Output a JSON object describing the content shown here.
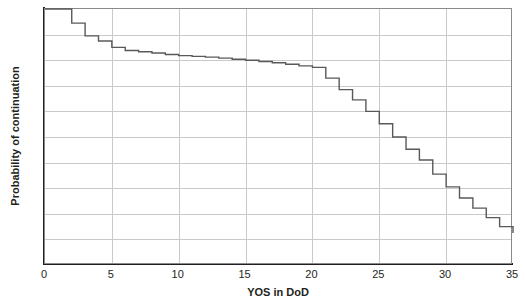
{
  "chart_data": {
    "type": "line",
    "subtype": "step",
    "title": "",
    "xlabel": "YOS in DoD",
    "ylabel": "Probability of continuation",
    "xlim": [
      0,
      35
    ],
    "ylim": [
      0,
      1
    ],
    "grid": true,
    "legend": null,
    "line_color": "#595959",
    "x_ticks": [
      "0",
      "5",
      "10",
      "15",
      "20",
      "25",
      "30",
      "35"
    ],
    "x_tick_values": [
      0,
      5,
      10,
      15,
      20,
      25,
      30,
      35
    ],
    "y_ticks": [
      "0",
      "0.1",
      "0.2",
      "0.3",
      "0.4",
      "0.5",
      "0.6",
      "0.7",
      "0.8",
      "0.9",
      "1"
    ],
    "y_tick_values": [
      0,
      0.1,
      0.2,
      0.3,
      0.4,
      0.5,
      0.6,
      0.7,
      0.8,
      0.9,
      1
    ],
    "x": [
      0,
      1,
      2,
      3,
      4,
      5,
      6,
      7,
      8,
      9,
      10,
      11,
      12,
      13,
      14,
      15,
      16,
      17,
      18,
      19,
      20,
      21,
      22,
      23,
      24,
      25,
      26,
      27,
      28,
      29,
      30,
      31,
      32,
      33,
      34,
      35
    ],
    "values": [
      1.0,
      1.0,
      0.945,
      0.895,
      0.875,
      0.85,
      0.838,
      0.833,
      0.828,
      0.822,
      0.818,
      0.815,
      0.812,
      0.808,
      0.804,
      0.8,
      0.795,
      0.79,
      0.784,
      0.778,
      0.772,
      0.73,
      0.685,
      0.645,
      0.6,
      0.552,
      0.5,
      0.452,
      0.41,
      0.355,
      0.305,
      0.262,
      0.222,
      0.185,
      0.15,
      0.125
    ]
  }
}
